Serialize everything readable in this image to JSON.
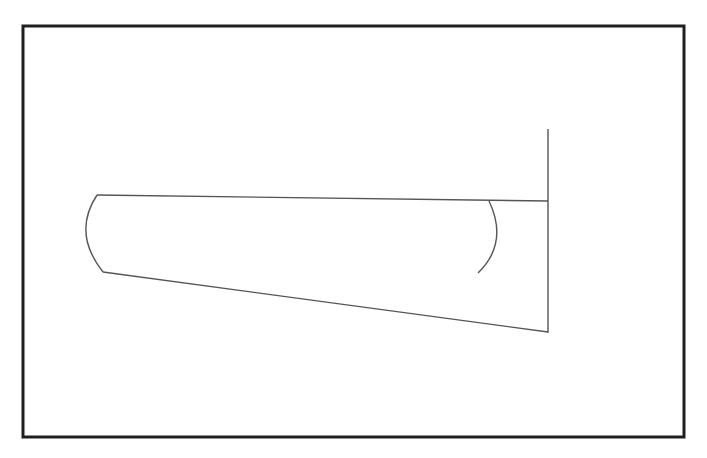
{
  "figure": {
    "kind": "technical-line-drawing",
    "canvas": {
      "width": 707,
      "height": 458,
      "background_color": "#ffffff"
    },
    "frame": {
      "name": "outer-border",
      "x": 23,
      "y": 26,
      "width": 661,
      "height": 411,
      "stroke_color": "#1f1f1f",
      "stroke_width": 3,
      "fill": "none"
    },
    "style": {
      "line_color": "#555555",
      "line_width": 1.4,
      "accent_color": "#1f1f1f"
    },
    "elements": [
      {
        "name": "leading-edge-nose-curve",
        "type": "arc",
        "start": [
          97,
          195
        ],
        "control": [
          72,
          233
        ],
        "end": [
          103,
          272
        ],
        "stroke_color": "#555555",
        "stroke_width": 1.4
      },
      {
        "name": "upper-chord-line",
        "type": "line",
        "start": [
          97,
          195
        ],
        "end": [
          548,
          201
        ],
        "stroke_color": "#555555",
        "stroke_width": 1.4
      },
      {
        "name": "lower-taper-line",
        "type": "line",
        "start": [
          103,
          272
        ],
        "end": [
          548,
          332
        ],
        "stroke_color": "#555555",
        "stroke_width": 1.4
      },
      {
        "name": "trailing-edge-vertical-line",
        "type": "line",
        "start": [
          548,
          129
        ],
        "end": [
          548,
          333
        ],
        "stroke_color": "#555555",
        "stroke_width": 1.4
      },
      {
        "name": "interior-section-curve",
        "type": "arc",
        "start": [
          489,
          201
        ],
        "control": [
          509,
          243
        ],
        "end": [
          478,
          273
        ],
        "stroke_color": "#555555",
        "stroke_width": 1.4
      }
    ]
  }
}
